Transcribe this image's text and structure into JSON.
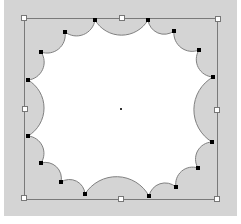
{
  "canvas": {
    "width": 241,
    "height": 224,
    "background": "#ffffff",
    "workspace_color": "#d4d4d4",
    "workspace": {
      "x": 4,
      "y": 0,
      "w": 233,
      "h": 216
    }
  },
  "shape": {
    "type": "scalloped-circle",
    "scallop_count": 16,
    "fill_inside": "#ffffff",
    "fill_outside": "#d4d4d4",
    "stroke": "#808080",
    "center": [
      121,
      109
    ],
    "vertices": [
      [
        95,
        20
      ],
      [
        65,
        32
      ],
      [
        41,
        52
      ],
      [
        28,
        80
      ],
      [
        28,
        136
      ],
      [
        41,
        163
      ],
      [
        61,
        182
      ],
      [
        85,
        194
      ],
      [
        149,
        196
      ],
      [
        176,
        187
      ],
      [
        198,
        168
      ],
      [
        212,
        142
      ],
      [
        213,
        77
      ],
      [
        199,
        50
      ],
      [
        174,
        31
      ],
      [
        148,
        20
      ]
    ]
  },
  "bounding_box": {
    "x": 24,
    "y": 18,
    "w": 193,
    "h": 181,
    "stroke": "#7a7a7a"
  },
  "handles": {
    "vertex_handle_color": "#000000",
    "box_handle_fill": "#ffffff",
    "box_handle_stroke": "#777777",
    "box_handles": [
      {
        "name": "top-left",
        "pos": [
          24,
          18
        ]
      },
      {
        "name": "top-center",
        "pos": [
          122,
          18
        ]
      },
      {
        "name": "top-right",
        "pos": [
          218,
          19
        ]
      },
      {
        "name": "middle-left",
        "pos": [
          25,
          109
        ]
      },
      {
        "name": "middle-right",
        "pos": [
          217,
          110
        ]
      },
      {
        "name": "bottom-left",
        "pos": [
          24,
          198
        ]
      },
      {
        "name": "bottom-center",
        "pos": [
          121,
          199
        ]
      },
      {
        "name": "bottom-right",
        "pos": [
          217,
          199
        ]
      }
    ],
    "center_marker": [
      121,
      109
    ]
  }
}
